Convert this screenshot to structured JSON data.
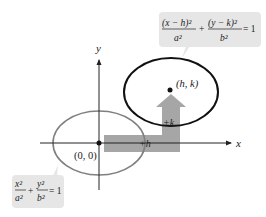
{
  "diagram": {
    "axes": {
      "x_label": "x",
      "y_label": "y"
    },
    "origin_label": "(0, 0)",
    "center_label": "(h, k)",
    "shift_labels": {
      "horizontal": "+h",
      "vertical": "+k"
    },
    "equations": {
      "translated": {
        "num1": "(x − h)²",
        "den1": "a²",
        "plus": "+",
        "num2": "(y − k)²",
        "den2": "b²",
        "eq": "= 1"
      },
      "standard": {
        "num1": "x²",
        "den1": "a²",
        "plus": "+",
        "num2": "y²",
        "den2": "b²",
        "eq": "= 1"
      }
    },
    "colors": {
      "original_ellipse": "#808080",
      "translated_ellipse": "#111111",
      "arrow": "#a6a6a6",
      "callout_bg": "#e6e6e6",
      "axes": "#222222"
    }
  }
}
